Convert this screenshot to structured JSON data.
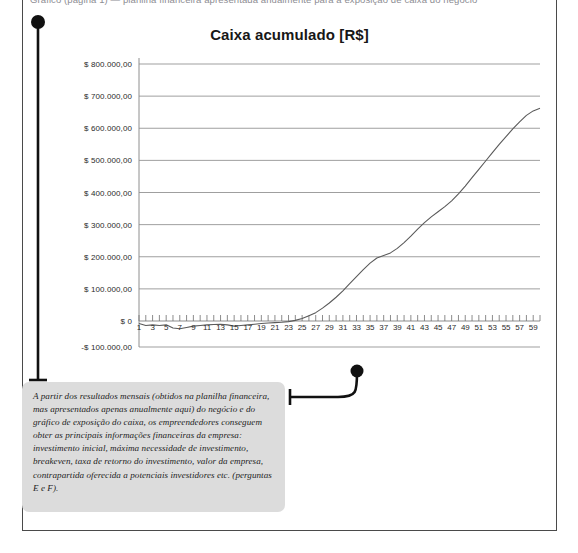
{
  "page": {
    "clipped_header_text": "Gráfico (página 1) — planilha financeira apresentada anualmente para a exposição de caixa do negócio"
  },
  "chart_data": {
    "type": "line",
    "title": "Caixa acumulado [R$]",
    "xlabel": "",
    "ylabel": "",
    "ylim": [
      -100000,
      800000
    ],
    "xlim": [
      1,
      60
    ],
    "grid": true,
    "legend": "none",
    "line_color": "#5a5a5a",
    "y_ticks": [
      "$ 800.000,00",
      "$ 700.000,00",
      "$ 600.000,00",
      "$ 500.000,00",
      "$ 400.000,00",
      "$ 300.000,00",
      "$ 200.000,00",
      "$ 100.000,00",
      "$ 0",
      "-$ 100.000,00"
    ],
    "y_tick_values": [
      800000,
      700000,
      600000,
      500000,
      400000,
      300000,
      200000,
      100000,
      0,
      -100000
    ],
    "x_ticks": [
      "1",
      "3",
      "5",
      "7",
      "9",
      "11",
      "13",
      "15",
      "17",
      "19",
      "21",
      "23",
      "25",
      "27",
      "29",
      "31",
      "33",
      "35",
      "37",
      "39",
      "41",
      "43",
      "45",
      "47",
      "49",
      "51",
      "53",
      "55",
      "57",
      "59"
    ],
    "x": [
      1,
      2,
      3,
      4,
      5,
      6,
      7,
      8,
      9,
      10,
      11,
      12,
      13,
      14,
      15,
      16,
      17,
      18,
      19,
      20,
      21,
      22,
      23,
      24,
      25,
      26,
      27,
      28,
      29,
      30,
      31,
      32,
      33,
      34,
      35,
      36,
      37,
      38,
      39,
      40,
      41,
      42,
      43,
      44,
      45,
      46,
      47,
      48,
      49,
      50,
      51,
      52,
      53,
      54,
      55,
      56,
      57,
      58,
      59,
      60
    ],
    "series": [
      {
        "name": "Caixa acumulado",
        "values": [
          -8000,
          -14000,
          -12000,
          -14000,
          -12000,
          -22000,
          -24000,
          -20000,
          -16000,
          -14000,
          -12000,
          -11000,
          -10000,
          -12000,
          -16000,
          -14000,
          -12000,
          -10000,
          -8000,
          -6000,
          -5000,
          -4000,
          -2000,
          2000,
          8000,
          16000,
          26000,
          40000,
          56000,
          74000,
          94000,
          116000,
          138000,
          160000,
          180000,
          196000,
          204000,
          212000,
          226000,
          244000,
          264000,
          286000,
          306000,
          324000,
          340000,
          356000,
          374000,
          396000,
          420000,
          446000,
          472000,
          498000,
          524000,
          550000,
          574000,
          598000,
          620000,
          640000,
          654000,
          662000
        ]
      }
    ]
  },
  "annotation": {
    "text": "A partir dos resultados mensais (obtidos na planilha financeira, mas apresentados apenas anualmente aqui) do negócio e do gráfico de exposição do caixa, os empreendedores conseguem obter as principais informações financeiras da empresa: investimento inicial, máxima necessidade de investimento, breakeven, taxa de retorno do investimento, valor da empresa, contrapartida oferecida a potenciais investidores etc. (perguntas E e F)."
  }
}
